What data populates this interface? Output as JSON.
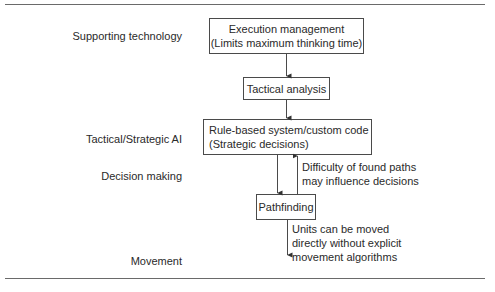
{
  "layers": [
    {
      "id": "supporting-technology",
      "label": "Supporting technology"
    },
    {
      "id": "tactical-strategic-ai",
      "label": "Tactical/Strategic AI"
    },
    {
      "id": "decision-making",
      "label": "Decision making"
    },
    {
      "id": "movement",
      "label": "Movement"
    }
  ],
  "boxes": {
    "execution": {
      "line1": "Execution management",
      "line2": "(Limits maximum thinking time)"
    },
    "tactical": {
      "line1": "Tactical analysis"
    },
    "rule_based": {
      "line1": "Rule-based system/custom code",
      "line2": "(Strategic decisions)"
    },
    "pathfinding": {
      "line1": "Pathfinding"
    }
  },
  "notes": {
    "feedback": {
      "line1": "Difficulty of found paths",
      "line2": "may influence decisions"
    },
    "movement": {
      "line1": "Units can be moved",
      "line2": "directly without explicit",
      "line3": "movement algorithms"
    }
  },
  "colors": {
    "line": "#4a4a4a",
    "rule": "#6a6a6a",
    "text": "#2a2a2a"
  }
}
